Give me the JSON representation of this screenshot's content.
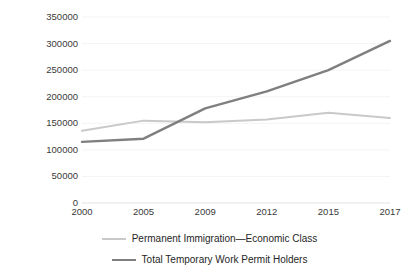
{
  "chart_data": {
    "type": "line",
    "title": "",
    "xlabel": "",
    "ylabel": "",
    "categories": [
      "2000",
      "2005",
      "2009",
      "2012",
      "2015",
      "2017"
    ],
    "ylim": [
      0,
      350000
    ],
    "y_ticks": [
      350000,
      300000,
      250000,
      200000,
      150000,
      100000,
      50000,
      0
    ],
    "y_tick_labels": [
      "350000",
      "300000",
      "250000",
      "200000",
      "150000",
      "100000",
      "50000",
      "0"
    ],
    "grid": true,
    "legend_position": "bottom",
    "series": [
      {
        "name": "Permanent Immigration—Economic Class",
        "color": "#c9c9c9",
        "values": [
          136000,
          155000,
          152000,
          157000,
          170000,
          160000
        ]
      },
      {
        "name": "Total Temporary Work Permit Holders",
        "color": "#7f7f7f",
        "values": [
          115000,
          121000,
          178000,
          210000,
          250000,
          305000
        ]
      }
    ]
  },
  "axes": {
    "axis_line_color": "#e8e8e8",
    "grid_line_color": "#f4f4f4",
    "tick_label_color": "#3a3a3a"
  }
}
